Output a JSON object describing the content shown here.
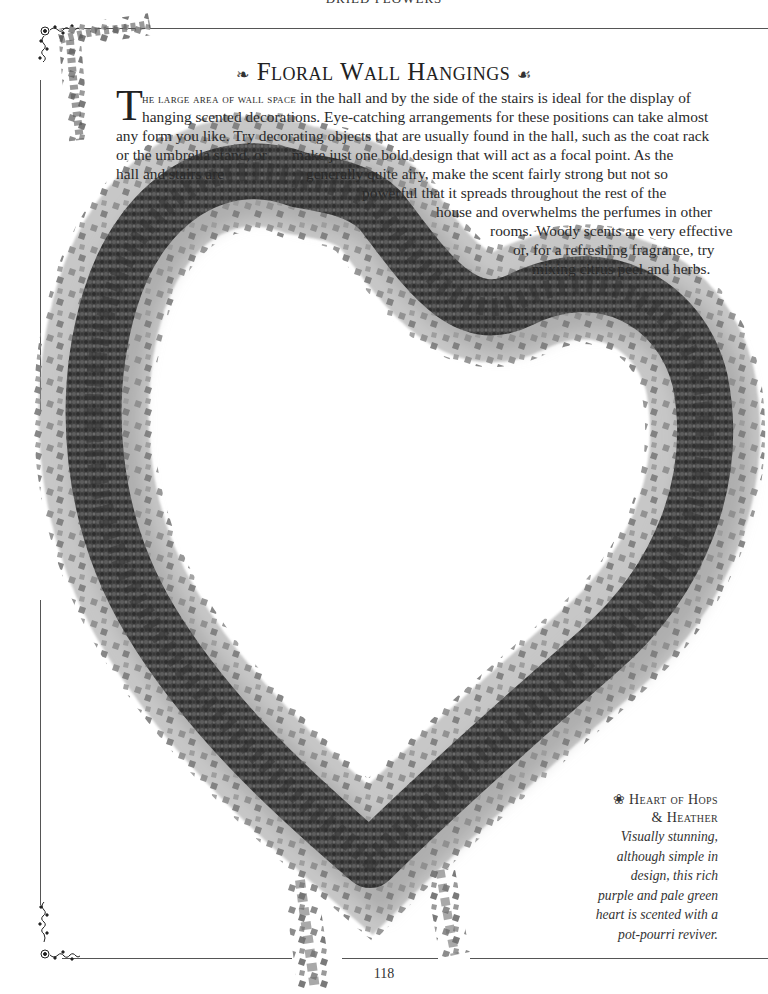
{
  "header": {
    "running_head": "DRIED FLOWERS"
  },
  "title": {
    "left_flourish": "❧",
    "text": "Floral Wall Hangings",
    "right_flourish": "☙"
  },
  "intro": {
    "dropcap": "T",
    "lead_smallcaps": "he large area of wall space",
    "lines": [
      " in the hall and by the side of the stairs is ideal for the display of",
      "hanging scented decorations. Eye-catching arrangements for these positions can take almost",
      "any form you like. Try decorating objects that are usually found in the hall, such as the coat rack",
      "or the umbrella stand, or",
      "make just one bold design that will act as a focal point. As the",
      "hall and stairs are",
      "generally quite airy, make the scent fairly strong but not so",
      "powerful that it spreads throughout the rest of the",
      "house and overwhelms the perfumes in other",
      "rooms. Woody scents are very effective",
      "or, for a refreshing fragrance, try",
      "mixing citrus peel and herbs."
    ]
  },
  "caption": {
    "bullet_icon": "❀",
    "title_line1": "Heart of Hops",
    "title_line2": "& Heather",
    "body": [
      "Visually stunning,",
      "although simple in",
      "design, this rich",
      "purple and pale green",
      "heart is scented with a",
      "pot-pourri reviver."
    ]
  },
  "footer": {
    "page_number": "118"
  },
  "ornaments": {
    "corner_top_left": "❦⁂",
    "corner_bottom_left": "❦⁂"
  },
  "colors": {
    "rule": "#555555",
    "text": "#2a2a2a",
    "foliage_dark": "#3a3a3a",
    "foliage_light": "#8a8a8a"
  }
}
